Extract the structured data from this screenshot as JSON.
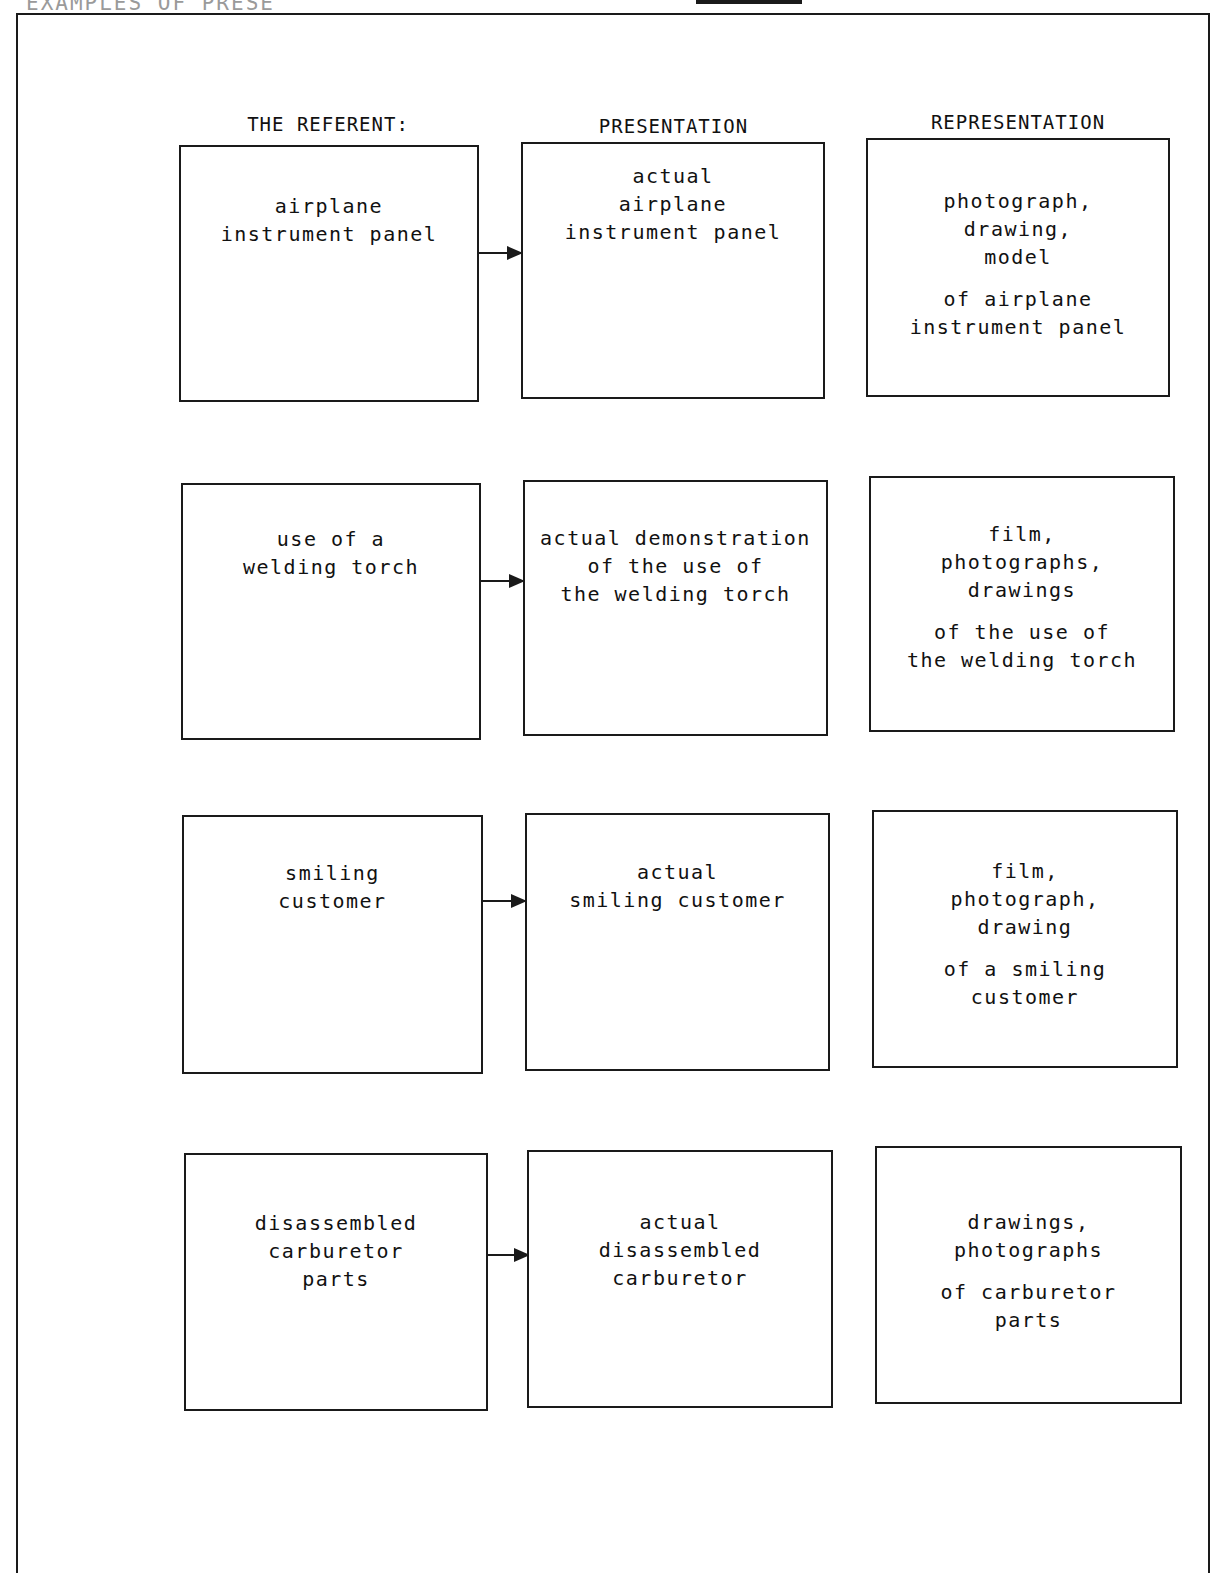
{
  "page": {
    "title_fragment": "EXAMPLES OF PRESE"
  },
  "headers": {
    "referent": [
      "THE REFERENT:",
      "WHAT IS TO BE",
      "PRESENTED OR REPRESENTED"
    ],
    "presentation": "PRESENTATION",
    "representation": "REPRESENTATION"
  },
  "rows": [
    {
      "referent": [
        "airplane",
        "instrument panel"
      ],
      "presentation": [
        "actual",
        "airplane",
        "instrument panel"
      ],
      "representation": {
        "media": [
          "photograph,",
          "drawing,",
          "model"
        ],
        "subject": [
          "of airplane",
          "instrument panel"
        ]
      }
    },
    {
      "referent": [
        "use of a",
        "welding torch"
      ],
      "presentation": [
        "actual demonstration",
        "of the use of",
        "the welding torch"
      ],
      "representation": {
        "media": [
          "film,",
          "photographs,",
          "drawings"
        ],
        "subject": [
          "of the use of",
          "the welding torch"
        ]
      }
    },
    {
      "referent": [
        "smiling",
        "customer"
      ],
      "presentation": [
        "actual",
        "smiling customer"
      ],
      "representation": {
        "media": [
          "film,",
          "photograph,",
          "drawing"
        ],
        "subject": [
          "of a smiling",
          "customer"
        ]
      }
    },
    {
      "referent": [
        "disassembled",
        "carburetor",
        "parts"
      ],
      "presentation": [
        "actual",
        "disassembled",
        "carburetor"
      ],
      "representation": {
        "media": [
          "drawings,",
          "photographs"
        ],
        "subject": [
          "of carburetor",
          "parts"
        ]
      }
    }
  ],
  "icons": {
    "arrow": "right-arrow-icon"
  }
}
